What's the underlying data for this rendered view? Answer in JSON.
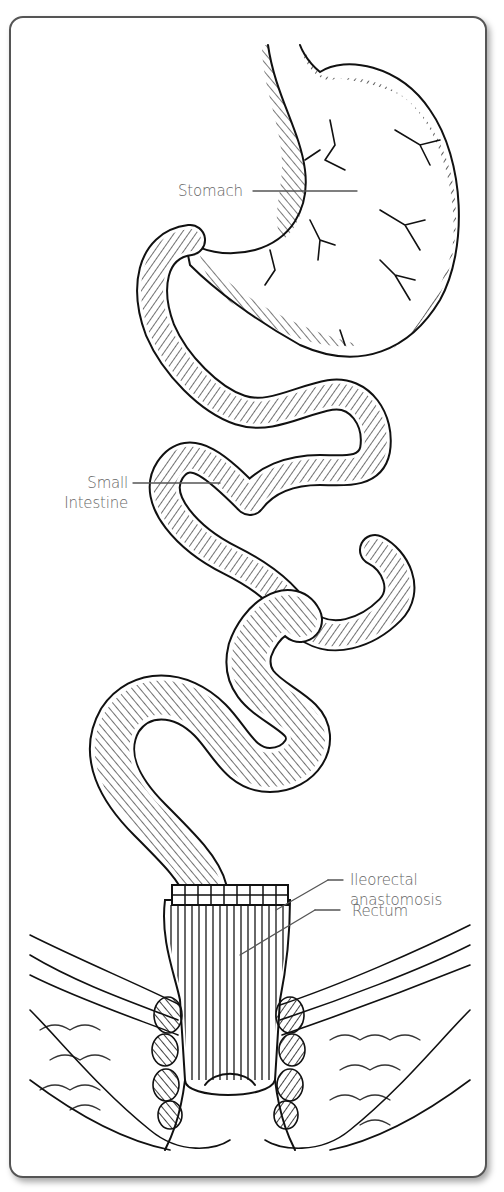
{
  "figure": {
    "type": "anatomical illustration",
    "colors": {
      "line": "#111111",
      "label": "#666666",
      "leader": "#555555",
      "frame": "#555555"
    }
  },
  "labels": {
    "stomach": "Stomach",
    "small_intestine_line1": "Small",
    "small_intestine_line2": "Intestine",
    "ileorectal_line1": "Ileorectal",
    "ileorectal_line2": "anastomosis",
    "rectum": "Rectum"
  }
}
